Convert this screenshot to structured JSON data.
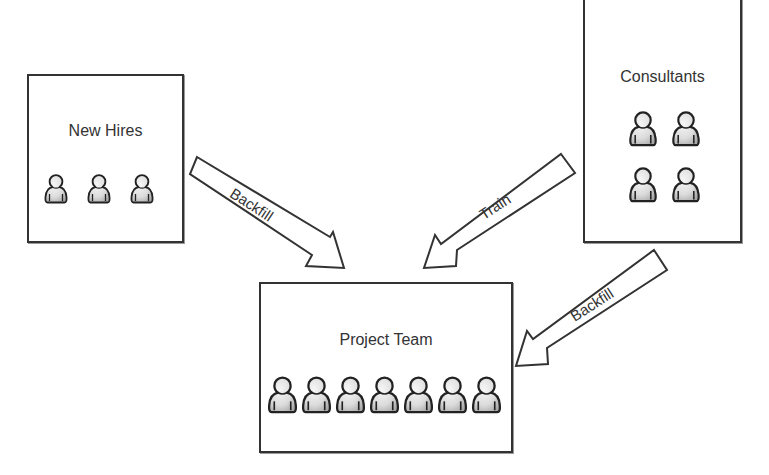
{
  "diagram": {
    "nodes": [
      {
        "id": "new_hires",
        "label": "New Hires",
        "person_count": 3,
        "rows": 1
      },
      {
        "id": "consultants",
        "label": "Consultants",
        "person_count": 4,
        "rows": 2
      },
      {
        "id": "project_team",
        "label": "Project Team",
        "person_count": 7,
        "rows": 1
      }
    ],
    "edges": [
      {
        "from": "new_hires",
        "to": "project_team",
        "label": "Backfill"
      },
      {
        "from": "consultants",
        "to": "project_team",
        "label": "Train"
      },
      {
        "from": "consultants",
        "to": "project_team",
        "label": "Backfill"
      }
    ]
  },
  "labels": {
    "new_hires": "New Hires",
    "consultants": "Consultants",
    "project_team": "Project Team",
    "arrow_backfill_left": "Backfill",
    "arrow_train": "Train",
    "arrow_backfill_right": "Backfill"
  },
  "icons": {
    "person": "person-icon",
    "arrow": "block-arrow-icon"
  },
  "colors": {
    "stroke": "#333333",
    "background": "#ffffff",
    "person_fill_light": "#f4f4f4",
    "person_fill_dark": "#b8b8b8"
  }
}
